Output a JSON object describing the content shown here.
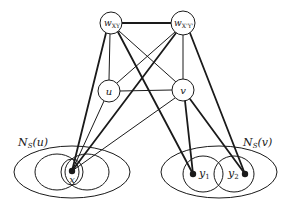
{
  "diagram": {
    "type": "graph",
    "nodes": [
      {
        "id": "wXY",
        "label": "w",
        "sub": "XY",
        "x": 111,
        "y": 23,
        "r": 11
      },
      {
        "id": "wX'Y'",
        "label": "w",
        "sub": "X'Y'",
        "x": 183,
        "y": 23,
        "r": 12
      },
      {
        "id": "u",
        "label": "u",
        "x": 109,
        "y": 91,
        "r": 11
      },
      {
        "id": "v",
        "label": "v",
        "x": 183,
        "y": 90,
        "r": 11
      },
      {
        "id": "x",
        "label": "x",
        "x": 72,
        "y": 171,
        "point": true
      },
      {
        "id": "y1",
        "label": "y",
        "sub": "1",
        "x": 193,
        "y": 174,
        "point": true
      },
      {
        "id": "y2",
        "label": "y",
        "sub": "2",
        "x": 245,
        "y": 174,
        "point": true
      }
    ],
    "edges": [
      {
        "from": "wXY",
        "to": "wX'Y'",
        "weight": "thick"
      },
      {
        "from": "wXY",
        "to": "u",
        "weight": "thin"
      },
      {
        "from": "wXY",
        "to": "v",
        "weight": "thin"
      },
      {
        "from": "wXY",
        "to": "x",
        "weight": "thick"
      },
      {
        "from": "wXY",
        "to": "y1",
        "weight": "thick"
      },
      {
        "from": "wX'Y'",
        "to": "u",
        "weight": "thin"
      },
      {
        "from": "wX'Y'",
        "to": "v",
        "weight": "thin"
      },
      {
        "from": "wX'Y'",
        "to": "x",
        "weight": "thick"
      },
      {
        "from": "wX'Y'",
        "to": "y2",
        "weight": "thick"
      },
      {
        "from": "u",
        "to": "v",
        "weight": "thin"
      },
      {
        "from": "u",
        "to": "x",
        "weight": "thin"
      },
      {
        "from": "v",
        "to": "x",
        "weight": "thin"
      },
      {
        "from": "v",
        "to": "y1",
        "weight": "thick"
      },
      {
        "from": "v",
        "to": "y2",
        "weight": "thick"
      }
    ],
    "sets": [
      {
        "id": "NSu",
        "label": "N",
        "sub": "S",
        "arg": "(u)",
        "label_x": 18,
        "label_y": 146
      },
      {
        "id": "NSv",
        "label": "N",
        "sub": "S",
        "arg": "(v)",
        "label_x": 243,
        "label_y": 146
      }
    ]
  },
  "labels": {
    "wxy_main": "w",
    "wxy_sub": "XY",
    "wxpyp_main": "w",
    "wxpyp_sub": "X'Y'",
    "u": "u",
    "v": "v",
    "x": "x",
    "y1_main": "y",
    "y1_sub": "1",
    "y2_main": "y",
    "y2_sub": "2",
    "nsu_main": "N",
    "nsu_sub": "S",
    "nsu_arg": "(u)",
    "nsv_main": "N",
    "nsv_sub": "S",
    "nsv_arg": "(v)"
  },
  "colors": {
    "stroke": "#1a1a1a",
    "background": "#ffffff"
  }
}
